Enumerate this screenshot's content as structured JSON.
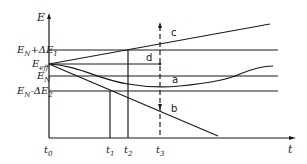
{
  "diagram": {
    "type": "energy-time schematic",
    "axes": {
      "y_label": "E",
      "x_label": "t"
    },
    "y_levels": [
      {
        "id": "en_plus_de1",
        "label": "E_N+ΔE_1",
        "display": "EN+ΔE1"
      },
      {
        "id": "eeff",
        "label": "E_eff",
        "display": "Eeff"
      },
      {
        "id": "en",
        "label": "E_N",
        "display": "EN"
      },
      {
        "id": "en_minus_de2",
        "label": "E_N-ΔE_2",
        "display": "EN-ΔE2"
      }
    ],
    "x_ticks": [
      {
        "id": "t0",
        "label": "t0"
      },
      {
        "id": "t1",
        "label": "t1"
      },
      {
        "id": "t2",
        "label": "t2"
      },
      {
        "id": "t3",
        "label": "t3"
      }
    ],
    "curves": [
      {
        "id": "a",
        "label": "a",
        "description": "dips below E_N then rises back toward E_eff"
      },
      {
        "id": "b",
        "label": "b",
        "description": "decreasing straight line from E_eff"
      },
      {
        "id": "c",
        "label": "c",
        "description": "increasing straight line from E_eff"
      },
      {
        "id": "d",
        "label": "d",
        "description": "horizontal at E_eff until t3"
      }
    ],
    "markers": {
      "t3_dashed_line": "dashed vertical line at t3 with arrows"
    }
  },
  "labels": {
    "E": "E",
    "t": "t",
    "EN_sub": "N",
    "plus_dE1": "+ΔE",
    "sub1": "1",
    "minus_dE2": "-ΔE",
    "sub2": "2",
    "Eeff_sub": "eff",
    "t_sub0": "0",
    "t_sub1": "1",
    "t_sub2": "2",
    "t_sub3": "3",
    "a": "a",
    "b": "b",
    "c": "c",
    "d": "d"
  }
}
